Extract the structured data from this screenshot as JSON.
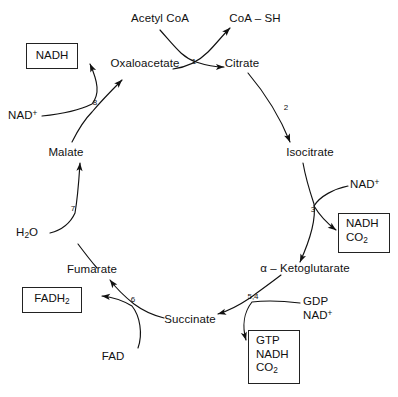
{
  "diagram": {
    "type": "metabolic-cycle",
    "background_color": "#ffffff",
    "stroke_color": "#111111",
    "cycle_metabolites": [
      {
        "id": "oxaloacetate",
        "label": "Oxaloacetate"
      },
      {
        "id": "citrate",
        "label": "Citrate"
      },
      {
        "id": "isocitrate",
        "label": "Isocitrate"
      },
      {
        "id": "ketoglutarate",
        "label_prefix": "α – ",
        "label_main": "Ketoglutarate",
        "label": "α – Ketoglutarate"
      },
      {
        "id": "succinate",
        "label": "Succinate"
      },
      {
        "id": "fumarate",
        "label": "Fumarate"
      },
      {
        "id": "malate",
        "label": "Malate"
      }
    ],
    "inputs": [
      {
        "id": "acetyl-coa",
        "label": "Acetyl CoA"
      },
      {
        "id": "nad-plus-left",
        "label_main": "NAD",
        "label_sup": "+",
        "label": "NAD+"
      },
      {
        "id": "water",
        "label_main": "H",
        "label_sub": "2",
        "label_tail": "O",
        "label": "H2O"
      },
      {
        "id": "fad",
        "label": "FAD"
      },
      {
        "id": "gdp",
        "label": "GDP"
      },
      {
        "id": "nad-plus-bottom",
        "label_main": "NAD",
        "label_sup": "+",
        "label": "NAD+"
      },
      {
        "id": "nad-plus-right",
        "label_main": "NAD",
        "label_sup": "+",
        "label": "NAD+"
      }
    ],
    "outputs": [
      {
        "id": "coa-sh",
        "label": "CoA – SH"
      }
    ],
    "product_boxes": [
      {
        "id": "nadh-box-top",
        "lines": [
          "NADH"
        ]
      },
      {
        "id": "nadh-co2-box",
        "lines": [
          "NADH",
          "CO2"
        ],
        "line1": "NADH",
        "line2_main": "CO",
        "line2_sub": "2"
      },
      {
        "id": "gtp-nadh-co2-box",
        "lines": [
          "GTP",
          "NADH",
          "CO2"
        ],
        "line1": "GTP",
        "line2": "NADH",
        "line3_main": "CO",
        "line3_sub": "2"
      },
      {
        "id": "fadh2-box",
        "lines": [
          "FADH2"
        ],
        "line1_main": "FADH",
        "line1_sub": "2"
      }
    ],
    "step_numbers": [
      {
        "id": "step-1",
        "label": "1"
      },
      {
        "id": "step-2",
        "label": "2"
      },
      {
        "id": "step-3",
        "label": "3"
      },
      {
        "id": "step-5-4",
        "label": "5,4"
      },
      {
        "id": "step-6",
        "label": "6"
      },
      {
        "id": "step-7",
        "label": "7"
      },
      {
        "id": "step-8",
        "label": "8"
      }
    ]
  }
}
